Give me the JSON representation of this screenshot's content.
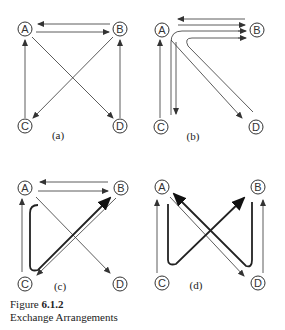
{
  "figure": {
    "number_prefix": "Figure ",
    "number": "6.1.2",
    "title": "Exchange Arrangements"
  },
  "nodes": [
    "A",
    "B",
    "C",
    "D"
  ],
  "panels": [
    {
      "label": "(a)",
      "description": "A→B, B→A, C→A, B→C, A→D, D→B"
    },
    {
      "label": "(b)",
      "description": "B→A, A→B, C→B via A, C→D via A, A→C, D→A"
    },
    {
      "label": "(c)",
      "description": "B→A, A→B, C→A, A→D, B→C, thick loop A-side via C to B"
    },
    {
      "label": "(d)",
      "description": "C→A, D→B, A→D, thick paths A→C→B and B→D→A"
    }
  ]
}
